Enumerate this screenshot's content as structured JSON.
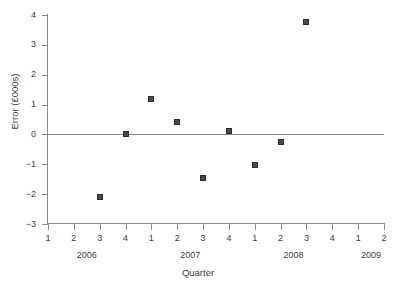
{
  "chart_data": {
    "type": "scatter",
    "title": "",
    "xlabel": "Quarter",
    "ylabel": "Error (£000s)",
    "ylim": [
      -3,
      4
    ],
    "yticks": [
      -3,
      -2,
      -1,
      0,
      1,
      2,
      3,
      4
    ],
    "ytick_labels": [
      "−3",
      "−2",
      "−1",
      "0",
      "1",
      "2",
      "3",
      "4"
    ],
    "grid": false,
    "legend": null,
    "zero_line": 0,
    "x_axis": {
      "tick_labels": [
        "1",
        "2",
        "3",
        "4",
        "1",
        "2",
        "3",
        "4",
        "1",
        "2",
        "3",
        "4",
        "1",
        "2"
      ],
      "group_labels": [
        "2006",
        "2007",
        "2008",
        "2009"
      ],
      "groups": [
        {
          "label": "2006",
          "quarters": [
            "1",
            "2",
            "3",
            "4"
          ]
        },
        {
          "label": "2007",
          "quarters": [
            "1",
            "2",
            "3",
            "4"
          ]
        },
        {
          "label": "2008",
          "quarters": [
            "1",
            "2",
            "3",
            "4"
          ]
        },
        {
          "label": "2009",
          "quarters": [
            "1",
            "2"
          ]
        }
      ]
    },
    "points": [
      {
        "label": "2006 Q3",
        "xindex": 2,
        "x": "2006 Q3",
        "y": -2.1
      },
      {
        "label": "2006 Q4",
        "xindex": 3,
        "x": "2006 Q4",
        "y": 0.0
      },
      {
        "label": "2007 Q1",
        "xindex": 4,
        "x": "2007 Q1",
        "y": 1.17
      },
      {
        "label": "2007 Q2",
        "xindex": 5,
        "x": "2007 Q2",
        "y": 0.43
      },
      {
        "label": "2007 Q3",
        "xindex": 6,
        "x": "2007 Q3",
        "y": -1.45
      },
      {
        "label": "2007 Q4",
        "xindex": 7,
        "x": "2007 Q4",
        "y": 0.12
      },
      {
        "label": "2008 Q1",
        "xindex": 8,
        "x": "2008 Q1",
        "y": -1.03
      },
      {
        "label": "2008 Q2",
        "xindex": 9,
        "x": "2008 Q2",
        "y": -0.25
      },
      {
        "label": "2008 Q3",
        "xindex": 10,
        "x": "2008 Q3",
        "y": 3.77
      }
    ],
    "colors": {
      "marker_fill": "#4a4a4a",
      "marker_edge": "#2b2b2b",
      "axis": "#8a8a8a",
      "text": "#3b3b3b",
      "background": "#ffffff"
    }
  }
}
